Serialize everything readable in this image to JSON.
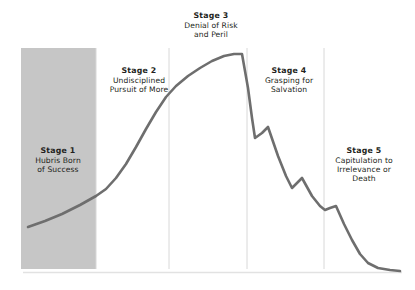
{
  "figure": {
    "name": "five-stages-of-decline-curve",
    "background_color": "#ffffff"
  },
  "colors": {
    "curve": "#6e6e6e",
    "shaded_band": "#c6c6c6",
    "divider": "#d8d8d8",
    "baseline": "#e2e2e2",
    "text": "#231f20"
  },
  "stages": [
    {
      "id": "stage-1",
      "title": "Stage 1",
      "description": "Hubris Born\nof Success",
      "highlighted": true
    },
    {
      "id": "stage-2",
      "title": "Stage 2",
      "description": "Undisciplined\nPursuit of More",
      "highlighted": false
    },
    {
      "id": "stage-3",
      "title": "Stage 3",
      "description": "Denial of Risk\nand Peril",
      "highlighted": false
    },
    {
      "id": "stage-4",
      "title": "Stage 4",
      "description": "Grasping for\nSalvation",
      "highlighted": false
    },
    {
      "id": "stage-5",
      "title": "Stage 5",
      "description": "Capitulation to\nIrrelevance or\nDeath",
      "highlighted": false
    }
  ],
  "chart_data": {
    "type": "line",
    "title": "",
    "subtitle": "",
    "xlabel": "",
    "ylabel": "",
    "grid": false,
    "legend": "none",
    "axis_ranges": {
      "x_pixels": [
        23,
        402
      ],
      "y_pixels": [
        48,
        272
      ]
    },
    "baseline_y_pixel": 272,
    "stage_boundaries_x_pixels": [
      23,
      96,
      169,
      247,
      324,
      402
    ],
    "highlight_band": {
      "x_start_pixel": 21,
      "x_end_pixel": 96,
      "y_top_pixel": 48,
      "y_bottom_pixel": 269,
      "color": "#c6c6c6"
    },
    "series": [
      {
        "name": "Organizational Performance",
        "description": "Rise then decline through the five stages of decline",
        "points_pixels": [
          [
            28,
            227
          ],
          [
            45,
            221
          ],
          [
            62,
            214
          ],
          [
            80,
            205
          ],
          [
            96,
            196
          ],
          [
            106,
            189
          ],
          [
            116,
            178
          ],
          [
            126,
            164
          ],
          [
            136,
            147
          ],
          [
            146,
            129
          ],
          [
            156,
            112
          ],
          [
            166,
            97
          ],
          [
            176,
            86
          ],
          [
            188,
            76
          ],
          [
            200,
            68
          ],
          [
            212,
            61
          ],
          [
            224,
            56
          ],
          [
            234,
            54
          ],
          [
            242,
            54
          ],
          [
            248,
            88
          ],
          [
            252,
            118
          ],
          [
            255,
            138
          ],
          [
            262,
            133
          ],
          [
            268,
            127
          ],
          [
            278,
            156
          ],
          [
            286,
            176
          ],
          [
            292,
            188
          ],
          [
            297,
            183
          ],
          [
            302,
            178
          ],
          [
            312,
            196
          ],
          [
            320,
            206
          ],
          [
            325,
            210
          ],
          [
            330,
            208
          ],
          [
            336,
            206
          ],
          [
            344,
            224
          ],
          [
            352,
            240
          ],
          [
            360,
            254
          ],
          [
            368,
            263
          ],
          [
            378,
            268
          ],
          [
            390,
            270
          ],
          [
            400,
            271
          ]
        ]
      }
    ]
  }
}
